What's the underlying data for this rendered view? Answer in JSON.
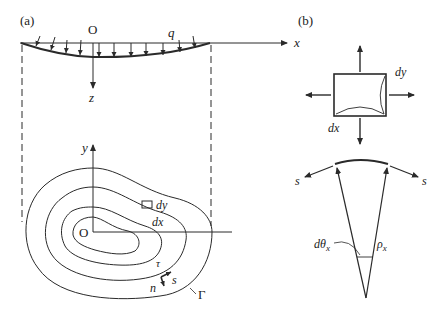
{
  "panels": {
    "a": {
      "label": "(a)",
      "section": {
        "origin_label": "O",
        "load_label": "q",
        "x_axis_label": "x",
        "z_axis_label": "z"
      },
      "plan": {
        "origin_label": "O",
        "x_axis_label": "x",
        "y_axis_label": "y",
        "element_dx_label": "dx",
        "element_dy_label": "dy",
        "tangent_label": "τ",
        "s_label": "s",
        "n_label": "n",
        "boundary_label": "Γ"
      }
    },
    "b": {
      "label": "(b)",
      "element": {
        "dx_label": "dx",
        "dy_label": "dy"
      },
      "curvature": {
        "s_left_label": "s",
        "s_right_label": "s",
        "angle_label": "dθ",
        "angle_sub": "x",
        "radius_label": "ρ",
        "radius_sub": "x"
      }
    }
  },
  "colors": {
    "line": "#2a2a2a",
    "background": "#ffffff"
  }
}
